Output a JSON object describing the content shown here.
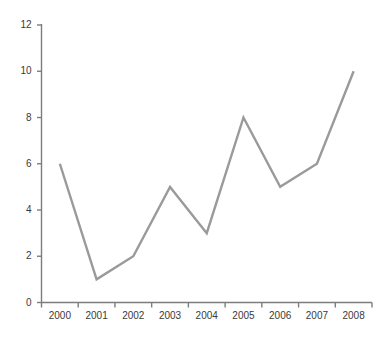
{
  "chart_data": {
    "type": "line",
    "title": "",
    "subtitle": "",
    "xlabel": "",
    "ylabel": "",
    "categories": [
      "2000",
      "2001",
      "2002",
      "2003",
      "2004",
      "2005",
      "2006",
      "2007",
      "2008"
    ],
    "values": [
      6,
      1,
      2,
      5,
      3,
      8,
      5,
      6,
      10
    ],
    "series": [
      {
        "name": "",
        "values": [
          6,
          1,
          2,
          5,
          3,
          8,
          5,
          6,
          10
        ],
        "color": "#9a9a9a"
      }
    ],
    "ylim": [
      0,
      12
    ],
    "yticks": [
      0,
      2,
      4,
      6,
      8,
      10,
      12
    ],
    "ytick_labels": [
      "0",
      "2",
      "4",
      "6",
      "8",
      "10",
      "12"
    ],
    "xtick_labels": [
      "2000",
      "2001",
      "2002",
      "2003",
      "2004",
      "2005",
      "2006",
      "2007",
      "2008"
    ],
    "grid": false,
    "legend": false,
    "legend_position": "none",
    "annotations": []
  },
  "style": {
    "line_color": "#9a9a9a",
    "axis_color": "#7d7d7d",
    "tick_label_color": "#3a3a3a",
    "background_color": "#ffffff"
  }
}
